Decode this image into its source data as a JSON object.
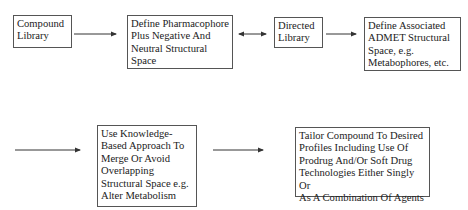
{
  "diagram": {
    "nodes": [
      {
        "id": "compound-library",
        "label": "Compound\nLibrary"
      },
      {
        "id": "define-pharmacophore",
        "label": "Define Pharmacophore\nPlus Negative And\nNeutral Structural\nSpace"
      },
      {
        "id": "directed-library",
        "label": "Directed\nLibrary"
      },
      {
        "id": "define-admet",
        "label": "Define Associated\nADMET Structural\nSpace, e.g.\nMetabophores, etc."
      },
      {
        "id": "knowledge-based",
        "label": "Use Knowledge-\nBased Approach To\nMerge Or Avoid\nOverlapping\nStructural Space e.g.\nAlter Metabolism"
      },
      {
        "id": "tailor-compound",
        "label": "Tailor Compound To Desired\nProfiles Including Use Of\nProdrug And/Or Soft Drug\nTechnologies Either Singly Or\nAs A Combination Of Agents"
      }
    ],
    "edges": [
      {
        "from": "compound-library",
        "to": "define-pharmacophore",
        "type": "directed"
      },
      {
        "from": "define-pharmacophore",
        "to": "directed-library",
        "type": "bidirectional"
      },
      {
        "from": "directed-library",
        "to": "define-admet",
        "type": "directed"
      },
      {
        "from": "define-admet",
        "to": "knowledge-based",
        "type": "directed-continuation"
      },
      {
        "from": "knowledge-based",
        "to": "tailor-compound",
        "type": "directed"
      }
    ]
  }
}
